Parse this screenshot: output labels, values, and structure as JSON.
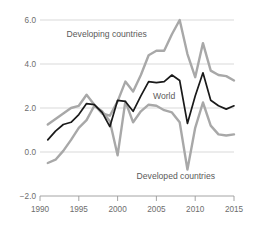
{
  "chart_data": {
    "type": "line",
    "title": "",
    "subtitle": "",
    "xlabel": "",
    "ylabel": "",
    "xlim": [
      1990,
      2015
    ],
    "ylim": [
      -2.0,
      6.0
    ],
    "grid": true,
    "legend_position": "inline-annotations",
    "x_ticks": [
      "1990",
      "1995",
      "2000",
      "2005",
      "2010",
      "2015"
    ],
    "x_tick_values": [
      1990,
      1995,
      2000,
      2005,
      2010,
      2015
    ],
    "y_ticks": [
      "6.0",
      "4.0",
      "2.0",
      "0.0",
      "−2.0"
    ],
    "y_tick_values": [
      6.0,
      4.0,
      2.0,
      0.0,
      -2.0
    ],
    "gridline_values": [
      6.0,
      4.0,
      2.0,
      0.0
    ],
    "x": [
      1991,
      1992,
      1993,
      1994,
      1995,
      1996,
      1997,
      1998,
      1999,
      2000,
      2001,
      2002,
      2003,
      2004,
      2005,
      2006,
      2007,
      2008,
      2009,
      2010,
      2011,
      2012,
      2013,
      2014,
      2015
    ],
    "series": [
      {
        "name": "Developing countries",
        "color": "#a8a8a8",
        "label": "Developing countries",
        "label_x": 1998.6,
        "label_y": 5.35,
        "values": [
          1.25,
          1.5,
          1.75,
          2.0,
          2.1,
          2.6,
          2.15,
          1.75,
          1.65,
          2.3,
          3.2,
          2.75,
          3.5,
          4.4,
          4.6,
          4.6,
          5.35,
          6.0,
          4.45,
          3.4,
          4.95,
          3.7,
          3.5,
          3.45,
          3.25
        ]
      },
      {
        "name": "World",
        "color": "#1a1a1a",
        "label": "World",
        "label_x": 2006.0,
        "label_y": 2.55,
        "values": [
          0.55,
          0.95,
          1.25,
          1.35,
          1.7,
          2.2,
          2.15,
          1.8,
          1.15,
          2.35,
          2.3,
          1.85,
          2.55,
          3.2,
          3.15,
          3.2,
          3.5,
          3.25,
          1.3,
          2.55,
          3.6,
          2.35,
          2.1,
          1.95,
          2.1
        ]
      },
      {
        "name": "Developed countries",
        "color": "#a8a8a8",
        "label": "Developed countries",
        "label_x": 2007.5,
        "label_y": -1.1,
        "values": [
          -0.5,
          -0.35,
          0.05,
          0.55,
          1.1,
          1.45,
          2.1,
          1.85,
          1.4,
          -0.15,
          2.3,
          1.35,
          1.85,
          2.15,
          2.1,
          1.9,
          1.8,
          1.35,
          -0.8,
          1.1,
          2.25,
          1.2,
          0.8,
          0.75,
          0.8
        ]
      }
    ]
  },
  "axis": {
    "x_axis_label": "",
    "y_axis_label": ""
  },
  "colors": {
    "gray_series": "#a8a8a8",
    "black_series": "#1a1a1a",
    "gridline": "#d5d5d5",
    "axis": "#9a9a9a",
    "tick_text": "#6d6d6d",
    "annotation_text": "#5a5a5a",
    "background": "#ffffff"
  }
}
